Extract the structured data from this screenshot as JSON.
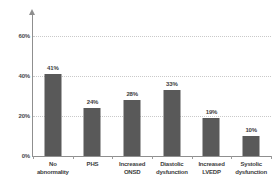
{
  "chart_data": {
    "type": "bar",
    "title": "",
    "subtitle": "",
    "xlabel": "",
    "ylabel": "",
    "categories": [
      "No abnormality",
      "PHS",
      "Increased ONSD",
      "Diastolic dysfunction",
      "Increased LVEDP",
      "Systolic dysfunction"
    ],
    "category_lines": [
      [
        "No",
        "abnormality"
      ],
      [
        "PHS",
        ""
      ],
      [
        "Increased",
        "ONSD"
      ],
      [
        "Diastolic",
        "dysfunction"
      ],
      [
        "Increased",
        "LVEDP"
      ],
      [
        "Systolic",
        "dysfunction"
      ]
    ],
    "values": [
      41,
      24,
      28,
      33,
      19,
      10
    ],
    "value_labels": [
      "41%",
      "24%",
      "28%",
      "33%",
      "19%",
      "10%"
    ],
    "ylim": [
      0,
      70
    ],
    "yticks": [
      0,
      20,
      40,
      60
    ],
    "ytick_labels": [
      "0%",
      "20%",
      "40%",
      "60%"
    ],
    "grid": true,
    "legend": "none",
    "bar_color": "#595959",
    "gridline_color": "#c9c9c9",
    "axis_color": "#8f8f8f",
    "label_color": "#3d3d3d",
    "background_color": "#ffffff"
  }
}
